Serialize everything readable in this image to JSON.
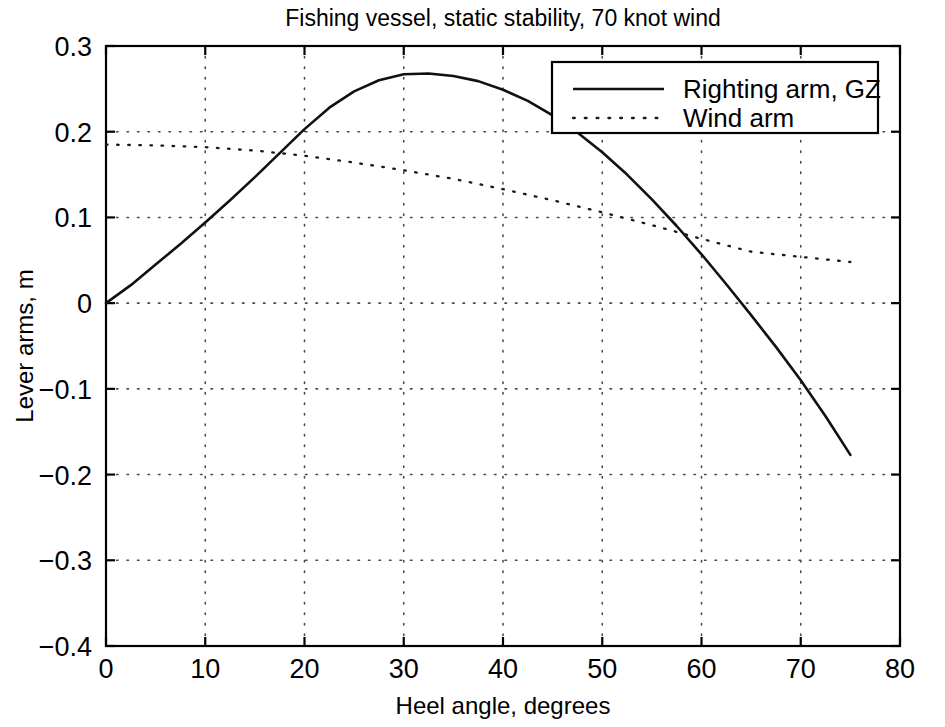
{
  "chart_data": {
    "type": "line",
    "title": "Fishing vessel, static stability, 70 knot wind",
    "xlabel": "Heel angle, degrees",
    "ylabel": "Lever arms, m",
    "xlim": [
      0,
      80
    ],
    "ylim": [
      -0.4,
      0.3
    ],
    "xticks": [
      0,
      10,
      20,
      30,
      40,
      50,
      60,
      70,
      80
    ],
    "xtick_labels": [
      "0",
      "10",
      "20",
      "30",
      "40",
      "50",
      "60",
      "70",
      "80"
    ],
    "yticks": [
      0.3,
      0.2,
      0.1,
      0,
      -0.1,
      -0.2,
      -0.3,
      -0.4
    ],
    "ytick_labels": [
      "0.3",
      "0.2",
      "0.1",
      "0",
      "−0.1",
      "−0.2",
      "−0.3",
      "−0.4"
    ],
    "grid": true,
    "grid_style": "dotted",
    "legend_position": "top-right",
    "series": [
      {
        "name": "Righting arm, GZ",
        "style": "solid",
        "color": "#111111",
        "x": [
          0,
          2.5,
          5,
          7.5,
          10,
          12.5,
          15,
          17.5,
          20,
          22.5,
          25,
          27.5,
          30,
          32.5,
          35,
          37.5,
          40,
          42.5,
          45,
          47.5,
          50,
          52.5,
          55,
          57.5,
          60,
          62.5,
          65,
          67.5,
          70,
          72.5,
          75
        ],
        "y": [
          0.0,
          0.021,
          0.045,
          0.069,
          0.094,
          0.12,
          0.147,
          0.175,
          0.203,
          0.228,
          0.247,
          0.26,
          0.267,
          0.268,
          0.265,
          0.259,
          0.249,
          0.236,
          0.219,
          0.199,
          0.176,
          0.15,
          0.121,
          0.09,
          0.057,
          0.022,
          -0.014,
          -0.051,
          -0.09,
          -0.132,
          -0.177
        ],
        "y_note": "values shown are a dense resampling of the plotted polyline"
      },
      {
        "name": "Wind arm",
        "style": "dotted",
        "color": "#1a1a1a",
        "x": [
          0,
          5,
          10,
          15,
          20,
          25,
          30,
          35,
          40,
          45,
          50,
          55,
          60,
          65,
          70,
          75
        ],
        "y": [
          0.185,
          0.184,
          0.182,
          0.178,
          0.172,
          0.164,
          0.155,
          0.145,
          0.133,
          0.12,
          0.106,
          0.091,
          0.075,
          0.06,
          0.054,
          0.048
        ]
      }
    ],
    "annotations": [
      {
        "label": "first-crossing",
        "x": 13.5,
        "y": 0.179
      },
      {
        "label": "gz-peak",
        "x": 26,
        "y": 0.268
      },
      {
        "label": "second-crossing",
        "x": 50,
        "y": 0.09
      },
      {
        "label": "gz-zero-crossing",
        "x": 63.5,
        "y": 0.0
      },
      {
        "label": "gz-curve-end",
        "x": 75,
        "y": -0.24
      }
    ]
  },
  "legend": {
    "entries": [
      {
        "label": "Righting arm, GZ",
        "style": "solid"
      },
      {
        "label": "Wind arm",
        "style": "dotted"
      }
    ]
  }
}
